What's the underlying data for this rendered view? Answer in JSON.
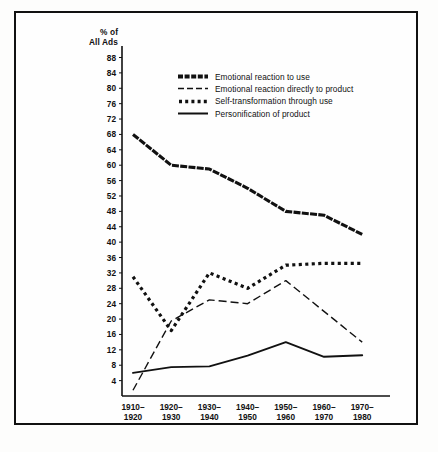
{
  "figure": {
    "background_color": "#fefefe",
    "border_color": "#111111",
    "line_color": "#111111"
  },
  "axes": {
    "y_axis_title_line1": "% of",
    "y_axis_title_line2": "All Ads",
    "y_ticks": [
      88,
      84,
      80,
      76,
      72,
      68,
      64,
      60,
      56,
      52,
      48,
      44,
      40,
      36,
      32,
      28,
      24,
      20,
      16,
      12,
      8,
      4
    ],
    "x_ticks": [
      {
        "line1": "1910–",
        "line2": "1920"
      },
      {
        "line1": "1920–",
        "line2": "1930"
      },
      {
        "line1": "1930–",
        "line2": "1940"
      },
      {
        "line1": "1940–",
        "line2": "1950"
      },
      {
        "line1": "1950–",
        "line2": "1960"
      },
      {
        "line1": "1960–",
        "line2": "1970"
      },
      {
        "line1": "1970–",
        "line2": "1980"
      }
    ]
  },
  "legend": {
    "items": [
      {
        "label": "Emotional reaction to use",
        "style": "thick-dash"
      },
      {
        "label": "Emotional reaction directly to product",
        "style": "dash"
      },
      {
        "label": "Self-transformation through use",
        "style": "dot"
      },
      {
        "label": "Personification of product",
        "style": "solid"
      }
    ]
  },
  "chart_data": {
    "type": "line",
    "title": "",
    "xlabel": "",
    "ylabel": "% of All Ads",
    "ylim": [
      0,
      90
    ],
    "grid": false,
    "legend_position": "top-center",
    "categories": [
      "1910–1920",
      "1920–1930",
      "1930–1940",
      "1940–1950",
      "1950–1960",
      "1960–1970",
      "1970–1980"
    ],
    "series": [
      {
        "name": "Emotional reaction to use",
        "style": "thick-dash",
        "values": [
          68,
          60,
          59,
          54,
          48,
          47,
          42
        ]
      },
      {
        "name": "Emotional reaction directly to product",
        "style": "dash",
        "values": [
          1.5,
          19.5,
          25,
          24,
          30,
          22,
          14
        ]
      },
      {
        "name": "Self-transformation through use",
        "style": "dot",
        "values": [
          31,
          17,
          32,
          28,
          34,
          34.5,
          34.5
        ]
      },
      {
        "name": "Personification of product",
        "style": "solid",
        "values": [
          6,
          7.5,
          7.7,
          10.5,
          14,
          10.2,
          10.6
        ]
      }
    ]
  },
  "caption": {
    "text": ""
  }
}
